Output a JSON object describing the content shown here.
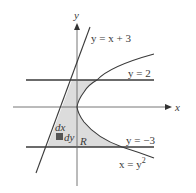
{
  "diagram": {
    "type": "region-between-curves",
    "axes": {
      "x_label": "x",
      "y_label": "y"
    },
    "curves": [
      {
        "id": "line",
        "equation": "y = x + 3",
        "label_main": "y = x + 3"
      },
      {
        "id": "parabola",
        "equation": "x = y^2",
        "label_main": "x = y",
        "label_sup": "2"
      },
      {
        "id": "upper",
        "equation": "y = 2",
        "label_main": "y = 2"
      },
      {
        "id": "lower",
        "equation": "y = -3",
        "label_main": "y = −3"
      }
    ],
    "region": {
      "label": "R",
      "fill": "#dcdcdc"
    },
    "element": {
      "dx_label": "dx",
      "dy_label": "dy",
      "color": "#555555"
    },
    "colors": {
      "lines": "#3a3a3a",
      "axes": "#555555"
    }
  }
}
